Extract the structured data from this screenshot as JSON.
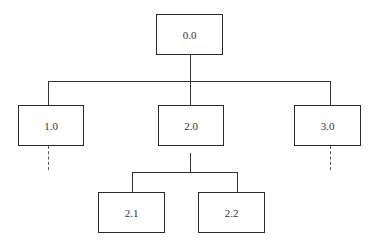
{
  "diagram": {
    "type": "hierarchy-tree",
    "nodes": {
      "root": {
        "label": "0.0"
      },
      "n1": {
        "label": "1.0"
      },
      "n2": {
        "label": "2.0"
      },
      "n3": {
        "label": "3.0"
      },
      "n21": {
        "label": "2.1"
      },
      "n22": {
        "label": "2.2"
      }
    },
    "edges": [
      [
        "0.0",
        "1.0"
      ],
      [
        "0.0",
        "2.0"
      ],
      [
        "0.0",
        "3.0"
      ],
      [
        "2.0",
        "2.1"
      ],
      [
        "2.0",
        "2.2"
      ]
    ],
    "continuations": [
      "1.0",
      "3.0"
    ]
  }
}
